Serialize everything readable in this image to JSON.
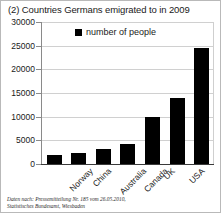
{
  "chart_data": {
    "type": "bar",
    "title": "(2) Countries Germans emigrated to in 2009",
    "xlabel": "",
    "ylabel": "",
    "categories": [
      "Norway",
      "China",
      "Australia",
      "Canada",
      "UK",
      "USA",
      "Switzerland"
    ],
    "values": [
      1800,
      2300,
      3100,
      4200,
      9900,
      13900,
      24500
    ],
    "series": [
      {
        "name": "number of people",
        "values": [
          1800,
          2300,
          3100,
          4200,
          9900,
          13900,
          24500
        ]
      }
    ],
    "ylim": [
      0,
      30000
    ],
    "ytick_labels": [
      "0",
      "5000",
      "10000",
      "15000",
      "20000",
      "25000",
      "30000"
    ],
    "ytick_values": [
      0,
      5000,
      10000,
      15000,
      20000,
      25000,
      30000
    ],
    "grid": true,
    "legend_position": "top-center",
    "legend_entries": [
      "number of people"
    ],
    "bar_color": "#000000"
  },
  "legend": {
    "label": "number of people",
    "swatch_color": "#000000"
  },
  "footnote": {
    "line1": "Daten nach: Pressemitteilung Nr. 185 vom 26.05.2010,",
    "line2": "Statistisches Bundesamt, Wiesbaden"
  },
  "colors": {
    "bar": "#000000",
    "grid": "#d0d0d0",
    "axis": "#3a3a3a",
    "border": "#b9b9b9",
    "text": "#1a1a1a"
  }
}
